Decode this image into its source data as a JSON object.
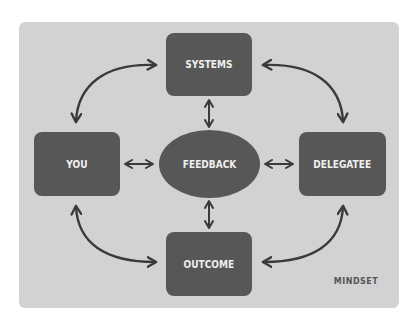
{
  "diagram": {
    "nodes": {
      "systems": {
        "label": "SYSTEMS",
        "shape": "rounded-rect"
      },
      "you": {
        "label": "YOU",
        "shape": "rounded-rect"
      },
      "feedback": {
        "label": "FEEDBACK",
        "shape": "ellipse"
      },
      "delegatee": {
        "label": "DELEGATEE",
        "shape": "rounded-rect"
      },
      "outcome": {
        "label": "OUTCOME",
        "shape": "rounded-rect"
      }
    },
    "edges": [
      {
        "from": "SYSTEMS",
        "to": "YOU",
        "type": "curved-bidirectional"
      },
      {
        "from": "SYSTEMS",
        "to": "DELEGATEE",
        "type": "curved-bidirectional"
      },
      {
        "from": "YOU",
        "to": "OUTCOME",
        "type": "curved-bidirectional"
      },
      {
        "from": "DELEGATEE",
        "to": "OUTCOME",
        "type": "curved-bidirectional"
      },
      {
        "from": "SYSTEMS",
        "to": "FEEDBACK",
        "type": "bidirectional"
      },
      {
        "from": "YOU",
        "to": "FEEDBACK",
        "type": "bidirectional"
      },
      {
        "from": "FEEDBACK",
        "to": "DELEGATEE",
        "type": "bidirectional"
      },
      {
        "from": "FEEDBACK",
        "to": "OUTCOME",
        "type": "bidirectional"
      }
    ],
    "caption": "MINDSET",
    "colors": {
      "panel": "#d2d2d2",
      "node_fill": "#575757",
      "node_text": "#efefef",
      "arrow": "#3a3a3a",
      "caption": "#555555"
    }
  }
}
